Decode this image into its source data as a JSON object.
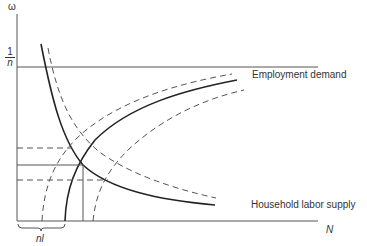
{
  "diagram": {
    "y_axis_label": "ω",
    "x_axis_label": "N",
    "y_tick": {
      "numerator": "1",
      "denominator": "n"
    },
    "curves": {
      "employment_demand": "Employment demand",
      "household_labor_supply": "Household labor supply"
    },
    "brace_label": "nl",
    "colors": {
      "line": "#222222",
      "axis": "#555555",
      "dashed": "#555555",
      "text": "#333333"
    }
  }
}
